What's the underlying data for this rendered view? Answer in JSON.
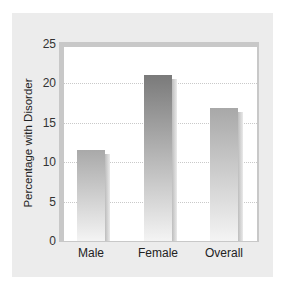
{
  "chart_data": {
    "type": "bar",
    "title": "",
    "xlabel": "",
    "ylabel": "Percentage with Disorder",
    "categories": [
      "Male",
      "Female",
      "Overall"
    ],
    "values": [
      11.5,
      21.0,
      16.8
    ],
    "ylim": [
      0,
      25
    ],
    "yticks": [
      "0",
      "5",
      "10",
      "15",
      "20",
      "25"
    ],
    "grid": true,
    "legend": null
  },
  "colors": {
    "panel_bg": "#ececec",
    "plot_bg": "#ffffff",
    "bar_male_top": "#a9a9a9",
    "bar_female_top": "#7a7a7a",
    "bar_overall_top": "#a8a8a8",
    "bar_bottom": "#f4f4f4"
  }
}
